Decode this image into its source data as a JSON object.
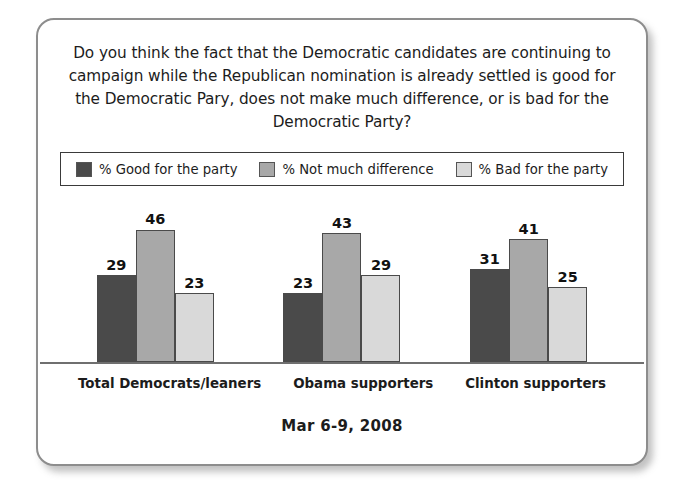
{
  "card": {
    "question": "Do you think the fact that the Democratic candidates are continuing to campaign while the Republican nomination is already settled is good for the Democratic Pary, does not make much difference, or is bad for the Democratic Party?",
    "footer_date": "Mar 6-9, 2008"
  },
  "legend": {
    "entries": [
      {
        "label": "% Good for the party",
        "color": "#4a4a4a"
      },
      {
        "label": "% Not much difference",
        "color": "#a8a8a8"
      },
      {
        "label": "% Bad for the party",
        "color": "#d9d9d9"
      }
    ]
  },
  "chart_data": {
    "type": "bar",
    "title": "Do you think the fact that the Democratic candidates are continuing to campaign while the Republican nomination is already settled is good for the Democratic Pary, does not make much difference, or is bad for the Democratic Party?",
    "subtitle": "Mar 6-9, 2008",
    "xlabel": "",
    "ylabel": "",
    "ylim": [
      0,
      50
    ],
    "grid": false,
    "legend_position": "top",
    "categories": [
      "Total Democrats/leaners",
      "Obama supporters",
      "Clinton supporters"
    ],
    "series": [
      {
        "name": "% Good for the party",
        "color": "#4a4a4a",
        "values": [
          29,
          23,
          31
        ]
      },
      {
        "name": "% Not much difference",
        "color": "#a8a8a8",
        "values": [
          46,
          43,
          41
        ]
      },
      {
        "name": "% Bad for the party",
        "color": "#d9d9d9",
        "values": [
          23,
          29,
          25
        ]
      }
    ]
  }
}
